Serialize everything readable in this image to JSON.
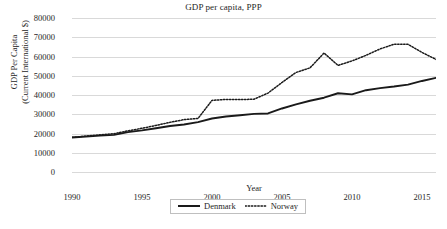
{
  "chart_data": {
    "type": "line",
    "title": "GDP per capita, PPP",
    "xlabel": "Year",
    "ylabel": "GDP Per Capita (Current International $)",
    "ylabel_line1": "GDP Per Capita",
    "ylabel_line2": "(Current International $)",
    "grid": true,
    "legend_position": "bottom",
    "xlim": [
      1990,
      2016
    ],
    "ylim": [
      0,
      80000
    ],
    "ytick_values": [
      80000,
      70000,
      60000,
      50000,
      40000,
      30000,
      20000,
      10000,
      0
    ],
    "ytick_labels": [
      "80000",
      "70000",
      "60000",
      "50000",
      "40000",
      "30000",
      "20000",
      "10000",
      "0"
    ],
    "xtick_values": [
      1990,
      1995,
      2000,
      2005,
      2010,
      2015
    ],
    "xtick_labels": [
      "1990",
      "1995",
      "2000",
      "2005",
      "2010",
      "2015"
    ],
    "x": [
      1990,
      1991,
      1992,
      1993,
      1994,
      1995,
      1996,
      1997,
      1998,
      1999,
      2000,
      2001,
      2002,
      2003,
      2004,
      2005,
      2006,
      2007,
      2008,
      2009,
      2010,
      2011,
      2012,
      2013,
      2014,
      2015,
      2016
    ],
    "series": [
      {
        "name": "Denmark",
        "style": "solid",
        "color": "#1a1a1a",
        "values": [
          17900,
          18400,
          18900,
          19300,
          20700,
          21600,
          22700,
          23900,
          24700,
          25900,
          27800,
          28800,
          29500,
          30200,
          30400,
          33000,
          35100,
          37000,
          38600,
          40900,
          40300,
          42500,
          43600,
          44400,
          45400,
          47300,
          48900
        ]
      },
      {
        "name": "Norway",
        "style": "dotted",
        "color": "#1a1a1a",
        "values": [
          18000,
          18700,
          19300,
          19900,
          21400,
          22700,
          24200,
          25800,
          27200,
          27800,
          37200,
          37700,
          37600,
          37800,
          41000,
          46500,
          51700,
          54100,
          61800,
          55400,
          57700,
          60600,
          63900,
          66400,
          66300,
          62100,
          58500
        ]
      }
    ],
    "annotations": []
  },
  "legend": {
    "items": [
      {
        "label": "Denmark",
        "style": "solid"
      },
      {
        "label": "Norway",
        "style": "dotted"
      }
    ]
  }
}
